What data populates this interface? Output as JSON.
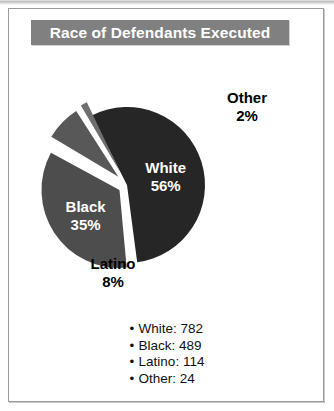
{
  "card": {
    "title": "Race of Defendants Executed"
  },
  "chart_data": {
    "type": "pie",
    "title": "Race of Defendants Executed",
    "categories": [
      "White",
      "Black",
      "Latino",
      "Other"
    ],
    "values": [
      782,
      489,
      114,
      24
    ],
    "percentages": [
      56,
      35,
      8,
      2
    ],
    "total": 1409,
    "exploded": true,
    "legend_position": "bottom",
    "grid": false,
    "slices": [
      {
        "label": "White",
        "percent_label": "56%",
        "percent": 56,
        "count": 782,
        "color": "#262626",
        "label_color": "#ffffff",
        "label_inside": true
      },
      {
        "label": "Black",
        "percent_label": "35%",
        "percent": 35,
        "count": 489,
        "color": "#4d4d4d",
        "label_color": "#ffffff",
        "label_inside": true
      },
      {
        "label": "Latino",
        "percent_label": "8%",
        "percent": 8,
        "count": 114,
        "color": "#585858",
        "label_color": "#000000",
        "label_inside": false
      },
      {
        "label": "Other",
        "percent_label": "2%",
        "percent": 2,
        "count": 24,
        "color": "#6e6e6e",
        "label_color": "#000000",
        "label_inside": false
      }
    ]
  },
  "legend": {
    "bullet": "•",
    "items": [
      {
        "text": "White: 782"
      },
      {
        "text": "Black: 489"
      },
      {
        "text": "Latino: 114"
      },
      {
        "text": "Other: 24"
      }
    ]
  },
  "colors": {
    "title_bar": "#808080",
    "title_text": "#ffffff",
    "card_border": "#9a9a9a",
    "background": "#ffffff",
    "slice_gap": "#ffffff"
  }
}
